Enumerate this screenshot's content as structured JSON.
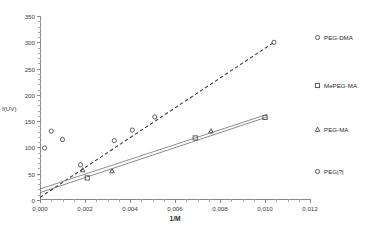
{
  "chart_data": {
    "type": "scatter",
    "title": "",
    "xlabel": "1/M",
    "ylabel": "f(UV)",
    "xlim": [
      0,
      0.012
    ],
    "ylim": [
      0,
      350
    ],
    "grid": false,
    "legend_position": "right",
    "x_ticks": [
      "0,000",
      "0,002",
      "0,004",
      "0,006",
      "0,008",
      "0,010",
      "0,012"
    ],
    "x_tick_values": [
      0,
      0.002,
      0.004,
      0.006,
      0.008,
      0.01,
      0.012
    ],
    "y_ticks": [
      "0",
      "50",
      "100",
      "150",
      "200",
      "250",
      "300",
      "350"
    ],
    "y_tick_values": [
      0,
      50,
      100,
      150,
      200,
      250,
      300,
      350
    ],
    "series": [
      {
        "name": "PEG-DMA",
        "marker": "circle",
        "line": "dashed",
        "points": [
          {
            "x": 0.0018,
            "y": 67
          },
          {
            "x": 0.0033,
            "y": 113
          },
          {
            "x": 0.0041,
            "y": 133
          },
          {
            "x": 0.0051,
            "y": 158
          },
          {
            "x": 0.0104,
            "y": 300
          }
        ],
        "fit_line": {
          "x0": 0.0,
          "y0": 5,
          "x1": 0.0104,
          "y1": 300
        }
      },
      {
        "name": "MePEG-MA",
        "marker": "square",
        "line": "solid",
        "points": [
          {
            "x": 0.0021,
            "y": 42
          },
          {
            "x": 0.0069,
            "y": 118
          },
          {
            "x": 0.01,
            "y": 157
          }
        ],
        "fit_line": {
          "x0": 0.0,
          "y0": 14,
          "x1": 0.0101,
          "y1": 158
        }
      },
      {
        "name": "PEG-MA",
        "marker": "triangle",
        "line": "solid",
        "points": [
          {
            "x": 0.0019,
            "y": 57
          },
          {
            "x": 0.0032,
            "y": 55
          },
          {
            "x": 0.0076,
            "y": 131
          }
        ],
        "fit_line": {
          "x0": 0.0,
          "y0": 21,
          "x1": 0.0101,
          "y1": 163
        }
      },
      {
        "name": "PEG|?|",
        "marker": "circle",
        "line": "none",
        "points": [
          {
            "x": 0.0002,
            "y": 99
          },
          {
            "x": 0.0005,
            "y": 131
          },
          {
            "x": 0.001,
            "y": 115
          }
        ]
      }
    ]
  },
  "legend": {
    "items": [
      {
        "label": "PEG-DMA",
        "marker": "circle"
      },
      {
        "label": "MePEG-MA",
        "marker": "square"
      },
      {
        "label": "PEG-MA",
        "marker": "triangle"
      },
      {
        "label": "PEG|?|",
        "marker": "circle"
      }
    ]
  },
  "colors": {
    "axis": "#8a8a8a",
    "text": "#2b2b2b",
    "marker": "#4a4a4a",
    "line": "#707070",
    "background": "#ffffff"
  }
}
